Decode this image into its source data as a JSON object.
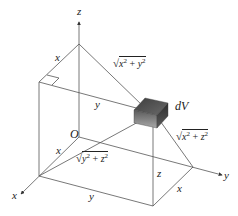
{
  "diagram": {
    "axes": {
      "z_label": "z",
      "y_label": "y",
      "x_label": "x",
      "origin_label": "O"
    },
    "element_label": "dV",
    "distance_labels": {
      "to_z_axis": {
        "radical": "√",
        "expr_base1": "x",
        "exp1": "2",
        "op": " + ",
        "expr_base2": "y",
        "exp2": "2"
      },
      "to_y_axis": {
        "radical": "√",
        "expr_base1": "x",
        "exp1": "2",
        "op": " + ",
        "expr_base2": "z",
        "exp2": "2"
      },
      "to_x_axis": {
        "radical": "√",
        "expr_base1": "y",
        "exp1": "2",
        "op": " + ",
        "expr_base2": "z",
        "exp2": "2"
      }
    },
    "edge_labels": {
      "top_x": "x",
      "top_y": "y",
      "left_x": "x",
      "bottom_y": "y",
      "right_x": "x",
      "vertical_z": "z"
    },
    "colors": {
      "line": "#555555",
      "box_dark": "#3a3a3a",
      "box_light": "#9a9a9a"
    }
  }
}
